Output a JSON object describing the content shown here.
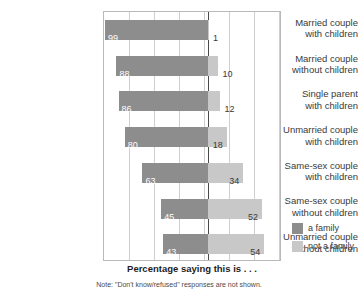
{
  "chart_data": {
    "type": "bar",
    "subtype": "diverging-stacked-bar",
    "title": "",
    "axis_title": "Percentage saying this is . . .",
    "footnote": "Note: \"Don't know/refused\" responses are not shown.",
    "xlabel": "",
    "ylabel": "",
    "grid": true,
    "gridlines": 7,
    "legend_position": "right-bottom",
    "center_axis_value": 0,
    "xlim": [
      -100,
      100
    ],
    "categories": [
      "Married couple with children",
      "Married couple without children",
      "Single parent with children",
      "Unmarried couple with children",
      "Same-sex couple with children",
      "Same-sex couple without children",
      "Unmarried couple without children"
    ],
    "series": [
      {
        "name": "a family",
        "color": "#8d8d8d",
        "direction": "left",
        "values": [
          99,
          88,
          86,
          80,
          63,
          45,
          43
        ]
      },
      {
        "name": "not a family",
        "color": "#c8c8c8",
        "direction": "right",
        "values": [
          1,
          10,
          12,
          18,
          34,
          52,
          54
        ]
      }
    ]
  },
  "rows": [
    {
      "label_line1": "Married couple",
      "label_line2": "with children",
      "family": 99,
      "not_family": 1
    },
    {
      "label_line1": "Married couple",
      "label_line2": "without children",
      "family": 88,
      "not_family": 10
    },
    {
      "label_line1": "Single parent",
      "label_line2": "with children",
      "family": 86,
      "not_family": 12
    },
    {
      "label_line1": "Unmarried couple",
      "label_line2": "with children",
      "family": 80,
      "not_family": 18
    },
    {
      "label_line1": "Same-sex couple",
      "label_line2": "with children",
      "family": 63,
      "not_family": 34
    },
    {
      "label_line1": "Same-sex couple",
      "label_line2": "without children",
      "family": 45,
      "not_family": 52
    },
    {
      "label_line1": "Unmarried couple",
      "label_line2": "without children",
      "family": 43,
      "not_family": 54
    }
  ],
  "legend": {
    "items": [
      {
        "label": "a family",
        "color": "#8d8d8d"
      },
      {
        "label": "not a family",
        "color": "#c8c8c8"
      }
    ]
  },
  "axis_title": "Percentage saying this is . . .",
  "footnote": "Note: \"Don't know/refused\" responses are not shown.",
  "colors": {
    "family": "#8d8d8d",
    "not_family": "#c8c8c8",
    "center_axis": "#4a4a4a",
    "grid": "#cfcfcf",
    "frame": "#b9b9b9",
    "text": "#3a3a3a"
  }
}
